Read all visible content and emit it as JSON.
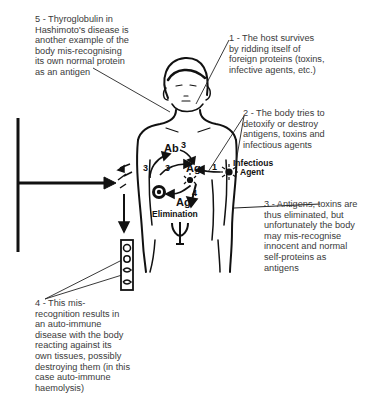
{
  "notes": {
    "n1": "1 - The host survives\nby ridding itself of\nforeign proteins (toxins,\ninfective agents, etc.)",
    "n2": "2 - The body tries to\ndetoxify or destroy\nantigens, toxins and\ninfectious agents",
    "n3": "3 - Antigens, toxins are\nthus eliminated, but\nunfortunately the body\nmay mis-recognise\ninnocent and normal\nself-proteins as\nantigens",
    "n4": "4 - This mis-\nrecognition results in\nan auto-immune\ndisease with the body\nreacting against its\nown tissues, possibly\ndestroying them (in this\ncase auto-immune\nhaemolysis)",
    "n5": "5 - Thyroglobulin in\nHashimoto's disease is\nanother example of the\nbody mis-recognising\nits own normal protein\nas an antigen"
  },
  "labels": {
    "ab": "Ab",
    "ag_top": "Ag",
    "ag_bottom": "Ag",
    "elimination": "Elimination",
    "infectious": "Infectious",
    "agent": "Agent",
    "step1": "1",
    "step3a": "3",
    "step3b": "3",
    "step3c": "3",
    "step4": "4"
  },
  "colors": {
    "ink": "#111111",
    "text": "#3a3a3a",
    "background": "#ffffff"
  }
}
